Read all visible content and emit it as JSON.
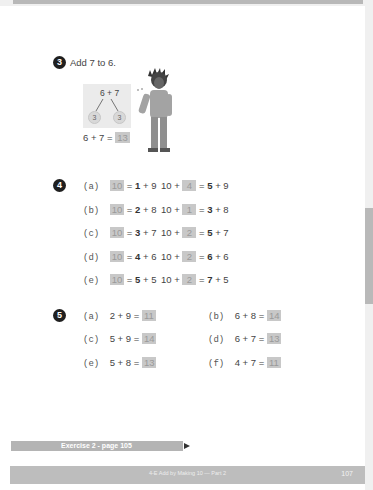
{
  "page": {
    "number": "107",
    "footer_title": "4-E  Add by Making 10 — Part 2",
    "exercise_link": "Exercise 2 - page 105"
  },
  "q3": {
    "number": "3",
    "prompt": "Add 7 to 6.",
    "bond": {
      "whole": "6 + 7",
      "parts": [
        "3",
        "3"
      ]
    },
    "equation": "6 + 7 =",
    "answer": "13"
  },
  "q4": {
    "number": "4",
    "rows": [
      {
        "label": "(a)",
        "left_ans": "10",
        "left_rhs_bold": "1",
        "left_rhs": "+ 9",
        "right_prefix": "10 +",
        "right_ans": "4",
        "right_rhs_bold": "5",
        "right_rhs": "+ 9"
      },
      {
        "label": "(b)",
        "left_ans": "10",
        "left_rhs_bold": "2",
        "left_rhs": "+ 8",
        "right_prefix": "10 +",
        "right_ans": "1",
        "right_rhs_bold": "3",
        "right_rhs": "+ 8"
      },
      {
        "label": "(c)",
        "left_ans": "10",
        "left_rhs_bold": "3",
        "left_rhs": "+ 7",
        "right_prefix": "10 +",
        "right_ans": "2",
        "right_rhs_bold": "5",
        "right_rhs": "+ 7"
      },
      {
        "label": "(d)",
        "left_ans": "10",
        "left_rhs_bold": "4",
        "left_rhs": "+ 6",
        "right_prefix": "10 +",
        "right_ans": "2",
        "right_rhs_bold": "6",
        "right_rhs": "+ 6"
      },
      {
        "label": "(e)",
        "left_ans": "10",
        "left_rhs_bold": "5",
        "left_rhs": "+ 5",
        "right_prefix": "10 +",
        "right_ans": "2",
        "right_rhs_bold": "7",
        "right_rhs": "+ 5"
      }
    ]
  },
  "q5": {
    "number": "5",
    "items": [
      {
        "label": "(a)",
        "expr": "2 + 9 =",
        "answer": "11"
      },
      {
        "label": "(b)",
        "expr": "6 + 8 =",
        "answer": "14"
      },
      {
        "label": "(c)",
        "expr": "5 + 9 =",
        "answer": "14"
      },
      {
        "label": "(d)",
        "expr": "6 + 7 =",
        "answer": "13"
      },
      {
        "label": "(e)",
        "expr": "5 + 8 =",
        "answer": "13"
      },
      {
        "label": "(f)",
        "expr": "4 + 7 =",
        "answer": "11"
      }
    ]
  }
}
